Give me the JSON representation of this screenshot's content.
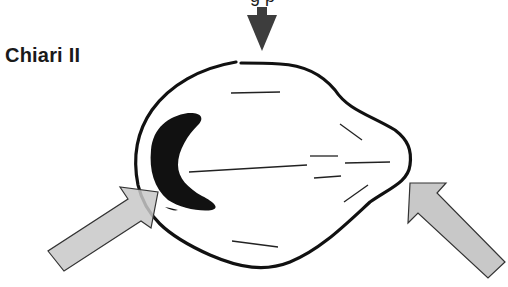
{
  "diagram": {
    "title": "Chiari II",
    "cropped_top_text": "g          p",
    "colors": {
      "outline": "#111111",
      "mass": "#111111",
      "top_arrow": "#3d3d3d",
      "side_arrows_fill": "#c8c8c8",
      "side_arrows_stroke": "#333333",
      "inner_lines": "#222222"
    },
    "elements": {
      "top_arrow": "downward pressure arrow",
      "left_arrow": "upward-right pressure arrow",
      "right_arrow": "upward-left pressure arrow",
      "outline": "skull/brain outline with gap at top",
      "mass": "dark crescent-shaped structure",
      "inner_lines": "short interior line segments"
    }
  }
}
